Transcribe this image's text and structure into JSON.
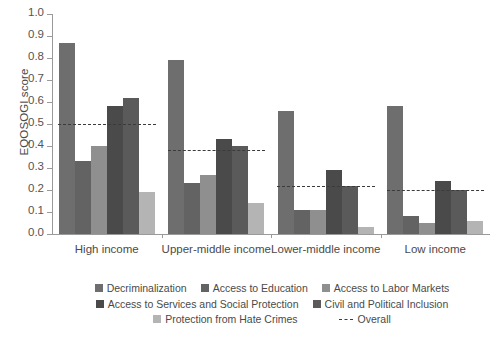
{
  "chart_data": {
    "type": "bar",
    "title": "",
    "xlabel": "",
    "ylabel": "EQOSOGI score",
    "ylim": [
      0,
      1.0
    ],
    "ytick_labels": [
      "1.0",
      "0.9",
      "0.8",
      "0.7",
      "0.6",
      "0.5",
      "0.4",
      "0.3",
      "0.2",
      "0.1",
      "0.0"
    ],
    "ytick_values": [
      1.0,
      0.9,
      0.8,
      0.7,
      0.6,
      0.5,
      0.4,
      0.3,
      0.2,
      0.1,
      0.0
    ],
    "grid": false,
    "legend_position": "bottom",
    "categories": [
      "High income",
      "Upper-middle income",
      "Lower-middle income",
      "Low income"
    ],
    "series": [
      {
        "name": "Decriminalization",
        "color": "#6e6e6e",
        "values": [
          0.87,
          0.79,
          0.56,
          0.58
        ]
      },
      {
        "name": "Access to Education",
        "color": "#636363",
        "values": [
          0.33,
          0.23,
          0.11,
          0.08
        ]
      },
      {
        "name": "Access to Labor Markets",
        "color": "#8f8f8f",
        "values": [
          0.4,
          0.27,
          0.11,
          0.05
        ]
      },
      {
        "name": "Access to Services and Social Protection",
        "color": "#4a4a4a",
        "values": [
          0.58,
          0.43,
          0.29,
          0.24
        ]
      },
      {
        "name": "Civil and Political Inclusion",
        "color": "#5a5a5a",
        "values": [
          0.62,
          0.4,
          0.22,
          0.2
        ]
      },
      {
        "name": "Protection from Hate Crimes",
        "color": "#b4b4b4",
        "values": [
          0.19,
          0.14,
          0.03,
          0.06
        ]
      }
    ],
    "reference_line": {
      "name": "Overall",
      "style": "dotted",
      "color": "#3b3b3b",
      "values": [
        0.5,
        0.38,
        0.22,
        0.2
      ]
    }
  },
  "legend": {
    "overall_label": "Overall"
  }
}
